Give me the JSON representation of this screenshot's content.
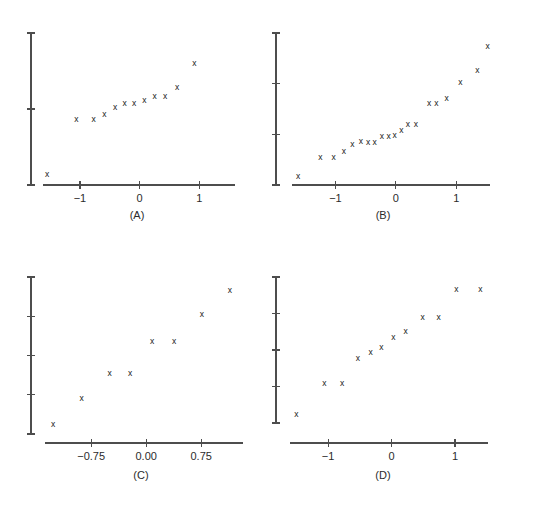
{
  "figure": {
    "background_color": "#ffffff",
    "axis_color": "#4d4d4d",
    "marker_color": "#1a1a1a",
    "marker_glyph": "x",
    "panel_count": 4
  },
  "chart_data": [
    {
      "id": "A",
      "type": "scatter",
      "title": "(A)",
      "xlabel": "",
      "ylabel": "",
      "grid": false,
      "legend": "none",
      "marker": "x",
      "xticks": [
        -1,
        0,
        1
      ],
      "xticklabels": [
        "−1",
        "0",
        "1"
      ],
      "yticks": [
        1,
        2,
        3
      ],
      "yticklabels": [
        "",
        "",
        ""
      ],
      "xlim": [
        -1.62,
        1.6
      ],
      "ylim": [
        0,
        4
      ],
      "points": [
        {
          "x": -1.55,
          "y": 0.28
        },
        {
          "x": -1.06,
          "y": 1.72
        },
        {
          "x": -0.77,
          "y": 1.73
        },
        {
          "x": -0.59,
          "y": 1.86
        },
        {
          "x": -0.41,
          "y": 2.02
        },
        {
          "x": -0.25,
          "y": 2.13
        },
        {
          "x": -0.09,
          "y": 2.13
        },
        {
          "x": 0.08,
          "y": 2.23
        },
        {
          "x": 0.25,
          "y": 2.32
        },
        {
          "x": 0.43,
          "y": 2.33
        },
        {
          "x": 0.63,
          "y": 2.55
        },
        {
          "x": 0.92,
          "y": 3.18
        }
      ]
    },
    {
      "id": "B",
      "type": "scatter",
      "title": "(B)",
      "xlabel": "",
      "ylabel": "",
      "grid": false,
      "legend": "none",
      "marker": "x",
      "xticks": [
        -1,
        0,
        1
      ],
      "xticklabels": [
        "−1",
        "0",
        "1"
      ],
      "yticks": [
        1,
        2,
        3,
        4
      ],
      "yticklabels": [
        "",
        "",
        "",
        ""
      ],
      "xlim": [
        -1.72,
        1.56
      ],
      "ylim": [
        0.2,
        4.7
      ],
      "points": [
        {
          "x": -1.62,
          "y": 0.44
        },
        {
          "x": -1.25,
          "y": 1.02
        },
        {
          "x": -1.03,
          "y": 1.01
        },
        {
          "x": -0.86,
          "y": 1.19
        },
        {
          "x": -0.72,
          "y": 1.39
        },
        {
          "x": -0.58,
          "y": 1.48
        },
        {
          "x": -0.46,
          "y": 1.45
        },
        {
          "x": -0.35,
          "y": 1.45
        },
        {
          "x": -0.23,
          "y": 1.62
        },
        {
          "x": -0.12,
          "y": 1.64
        },
        {
          "x": -0.02,
          "y": 1.65
        },
        {
          "x": 0.09,
          "y": 1.8
        },
        {
          "x": 0.2,
          "y": 1.97
        },
        {
          "x": 0.33,
          "y": 1.97
        },
        {
          "x": 0.55,
          "y": 2.62
        },
        {
          "x": 0.67,
          "y": 2.62
        },
        {
          "x": 0.84,
          "y": 2.74
        },
        {
          "x": 1.07,
          "y": 3.23
        },
        {
          "x": 1.35,
          "y": 3.59
        },
        {
          "x": 1.52,
          "y": 4.3
        }
      ]
    },
    {
      "id": "C",
      "type": "scatter",
      "title": "(C)",
      "xlabel": "",
      "ylabel": "",
      "grid": false,
      "legend": "none",
      "marker": "x",
      "xticks": [
        -0.75,
        0.0,
        0.75
      ],
      "xticklabels": [
        "−0.75",
        "0.00",
        "0.75"
      ],
      "yticks": [
        1,
        2,
        3,
        4,
        5
      ],
      "yticklabels": [
        "",
        "",
        "",
        "",
        ""
      ],
      "xlim": [
        -1.38,
        1.32
      ],
      "ylim": [
        0.72,
        5.42
      ],
      "points": [
        {
          "x": -1.27,
          "y": 1.0
        },
        {
          "x": -0.88,
          "y": 1.78
        },
        {
          "x": -0.5,
          "y": 2.51
        },
        {
          "x": -0.22,
          "y": 2.52
        },
        {
          "x": 0.08,
          "y": 3.48
        },
        {
          "x": 0.38,
          "y": 3.48
        },
        {
          "x": 0.76,
          "y": 4.3
        },
        {
          "x": 1.14,
          "y": 5.02
        }
      ]
    },
    {
      "id": "D",
      "type": "scatter",
      "title": "(D)",
      "xlabel": "",
      "ylabel": "",
      "grid": false,
      "legend": "none",
      "marker": "x",
      "xticks": [
        -1,
        0,
        1
      ],
      "xticklabels": [
        "−1",
        "0",
        "1"
      ],
      "yticks": [
        1,
        2,
        3,
        4,
        5
      ],
      "yticklabels": [
        "",
        "",
        "",
        "",
        ""
      ],
      "xlim": [
        -1.6,
        1.52
      ],
      "ylim": [
        0.5,
        5.5
      ],
      "points": [
        {
          "x": -1.5,
          "y": 0.78
        },
        {
          "x": -1.06,
          "y": 1.86
        },
        {
          "x": -0.78,
          "y": 1.86
        },
        {
          "x": -0.53,
          "y": 2.7
        },
        {
          "x": -0.33,
          "y": 2.89
        },
        {
          "x": -0.16,
          "y": 3.08
        },
        {
          "x": 0.03,
          "y": 3.41
        },
        {
          "x": 0.22,
          "y": 3.63
        },
        {
          "x": 0.49,
          "y": 4.09
        },
        {
          "x": 0.74,
          "y": 4.09
        },
        {
          "x": 1.02,
          "y": 5.05
        },
        {
          "x": 1.4,
          "y": 5.05
        }
      ]
    }
  ]
}
